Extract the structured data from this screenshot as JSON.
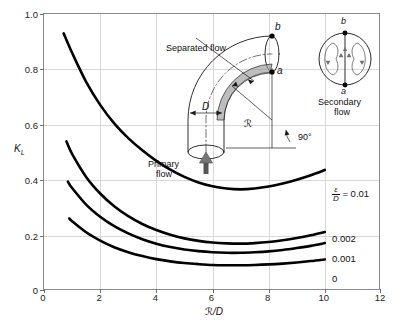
{
  "chart_data": {
    "type": "line",
    "title": "",
    "xlabel": "ℛ/D",
    "ylabel": "K_L",
    "xlim": [
      0,
      12
    ],
    "ylim": [
      0,
      1.0
    ],
    "xticks": [
      0,
      2,
      4,
      6,
      8,
      10,
      12
    ],
    "yticks": [
      0,
      0.2,
      0.4,
      0.6,
      0.8,
      1.0
    ],
    "xtick_labels": [
      "0",
      "2",
      "4",
      "6",
      "8",
      "10",
      "12"
    ],
    "ytick_labels": [
      "0",
      "0.2",
      "0.4",
      "0.6",
      "0.8",
      "1.0"
    ],
    "grid": true,
    "legend_position": "right-inline",
    "series": [
      {
        "name": "ε/D = 0.01",
        "label": "0.01",
        "color": "#000000",
        "x": [
          0.7,
          1.0,
          1.5,
          2.0,
          2.5,
          3.0,
          3.5,
          4.0,
          4.5,
          5.0,
          5.5,
          6.0,
          6.5,
          7.0,
          7.5,
          8.0,
          8.5,
          9.0,
          9.5,
          10.0
        ],
        "y": [
          0.93,
          0.86,
          0.755,
          0.672,
          0.605,
          0.552,
          0.508,
          0.47,
          0.438,
          0.412,
          0.392,
          0.378,
          0.37,
          0.367,
          0.37,
          0.377,
          0.388,
          0.402,
          0.418,
          0.437
        ]
      },
      {
        "name": "ε/D = 0.002",
        "label": "0.002",
        "color": "#000000",
        "x": [
          0.8,
          1.0,
          1.5,
          2.0,
          2.5,
          3.0,
          3.5,
          4.0,
          4.5,
          5.0,
          5.5,
          6.0,
          6.5,
          7.0,
          7.5,
          8.0,
          8.5,
          9.0,
          9.5,
          10.0
        ],
        "y": [
          0.54,
          0.495,
          0.412,
          0.352,
          0.306,
          0.27,
          0.242,
          0.22,
          0.203,
          0.19,
          0.181,
          0.175,
          0.172,
          0.171,
          0.173,
          0.177,
          0.183,
          0.191,
          0.201,
          0.213
        ]
      },
      {
        "name": "ε/D = 0.001",
        "label": "0.001",
        "color": "#000000",
        "x": [
          0.85,
          1.0,
          1.5,
          2.0,
          2.5,
          3.0,
          3.5,
          4.0,
          4.5,
          5.0,
          5.5,
          6.0,
          6.5,
          7.0,
          7.5,
          8.0,
          8.5,
          9.0,
          9.5,
          10.0
        ],
        "y": [
          0.395,
          0.372,
          0.312,
          0.268,
          0.234,
          0.208,
          0.187,
          0.171,
          0.159,
          0.15,
          0.144,
          0.14,
          0.138,
          0.138,
          0.14,
          0.143,
          0.148,
          0.155,
          0.163,
          0.173
        ]
      },
      {
        "name": "ε/D = 0",
        "label": "0",
        "color": "#000000",
        "x": [
          0.9,
          1.0,
          1.5,
          2.0,
          2.5,
          3.0,
          3.5,
          4.0,
          4.5,
          5.0,
          5.5,
          6.0,
          6.5,
          7.0,
          7.5,
          8.0,
          8.5,
          9.0,
          9.5,
          10.0
        ],
        "y": [
          0.262,
          0.252,
          0.212,
          0.182,
          0.158,
          0.14,
          0.126,
          0.115,
          0.107,
          0.101,
          0.097,
          0.094,
          0.093,
          0.093,
          0.094,
          0.096,
          0.099,
          0.103,
          0.108,
          0.114
        ]
      }
    ],
    "annotations": [
      {
        "text": "ε/D = 0.01",
        "kind": "curve-label"
      },
      {
        "text": "0.002",
        "kind": "curve-label"
      },
      {
        "text": "0.001",
        "kind": "curve-label"
      },
      {
        "text": "0",
        "kind": "curve-label"
      }
    ]
  },
  "axes": {
    "y_title_main": "K",
    "y_title_sub": "L",
    "x_title": "ℛ/D"
  },
  "curve_labels": {
    "eps_numerator": "ε",
    "eps_denominator": "D",
    "eps_equals": "= 0.01",
    "l2": "0.002",
    "l3": "0.001",
    "l4": "0"
  },
  "diagram": {
    "separated_flow": "Separated flow",
    "primary_flow_line1": "Primary",
    "primary_flow_line2": "flow",
    "diameter_label": "D",
    "radius_label": "ℛ",
    "angle_label": "90°",
    "point_a": "a",
    "point_b": "b"
  },
  "inset": {
    "point_b": "b",
    "point_a": "a",
    "caption_line1": "Secondary",
    "caption_line2": "flow"
  }
}
